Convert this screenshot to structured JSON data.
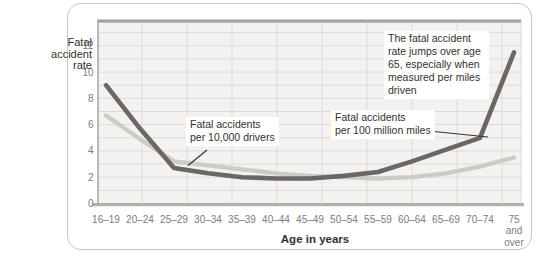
{
  "page": {
    "background": "#ffffff"
  },
  "card": {
    "background": "#ffffff",
    "border_color": "#c9c6c3"
  },
  "chart_data": {
    "type": "line",
    "title": "",
    "xlabel": "Age in years",
    "ylabel": "Fatal\naccident\nrate",
    "categories": [
      "16–19",
      "20–24",
      "25–29",
      "30–34",
      "35–39",
      "40–44",
      "45–49",
      "50–54",
      "55–59",
      "60–64",
      "65–69",
      "70–74",
      "75\nand\nover"
    ],
    "y_ticks": [
      0,
      2,
      4,
      6,
      8,
      10,
      12
    ],
    "ylim": [
      0,
      14
    ],
    "grid": true,
    "legend_position": "none",
    "plot_background": "#f4f2f0",
    "gridline_color": "#dedad7",
    "axis_color": "#aaa6a2",
    "tick_label_color": "#807c79",
    "series": [
      {
        "name": "Fatal accidents per 10,000 drivers",
        "color": "#cdcbc5",
        "values": [
          6.7,
          4.9,
          3.2,
          2.9,
          2.6,
          2.3,
          2.1,
          2.0,
          1.9,
          2.0,
          2.3,
          2.8,
          3.5
        ]
      },
      {
        "name": "Fatal accidents per 100 million miles",
        "color": "#6b6765",
        "values": [
          9.0,
          5.7,
          2.7,
          2.3,
          2.0,
          1.9,
          1.9,
          2.1,
          2.4,
          3.2,
          4.1,
          5.0,
          11.5
        ]
      }
    ],
    "annotations": {
      "note": "The fatal accident\nrate jumps over age\n65, especially when\nmeasured per miles\ndriven",
      "label_miles": "Fatal accidents\nper 100 million miles",
      "label_drivers": "Fatal accidents\nper 10,000 drivers"
    }
  }
}
